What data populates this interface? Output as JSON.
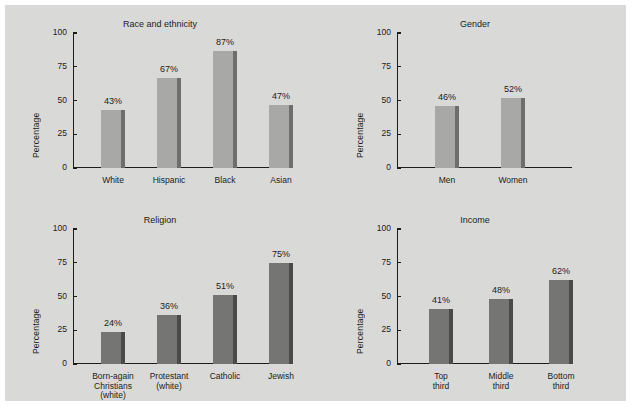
{
  "figure": {
    "background_color": "#d9d9d7",
    "outer_background_color": "#ffffff",
    "axis_color": "#1c1c1c",
    "text_color": "#1c1c1c"
  },
  "chart_data": [
    {
      "type": "bar",
      "title": "Race and ethnicity",
      "xlabel": "",
      "ylabel": "Percentage",
      "ylim": [
        0,
        100
      ],
      "yticks": [
        0,
        25,
        50,
        75,
        100
      ],
      "grid": false,
      "legend": "none",
      "bar_color": "#a8a8a6",
      "bar_shadow_color": "#6e6e6c",
      "categories": [
        "White",
        "Hispanic",
        "Black",
        "Asian"
      ],
      "values": [
        43,
        67,
        87,
        47
      ],
      "data_labels": [
        "43%",
        "67%",
        "87%",
        "47%"
      ]
    },
    {
      "type": "bar",
      "title": "Gender",
      "xlabel": "",
      "ylabel": "Percentage",
      "ylim": [
        0,
        100
      ],
      "yticks": [
        0,
        25,
        50,
        75,
        100
      ],
      "grid": false,
      "legend": "none",
      "bar_color": "#a8a8a6",
      "bar_shadow_color": "#6e6e6c",
      "categories": [
        "Men",
        "Women"
      ],
      "values": [
        46,
        52
      ],
      "data_labels": [
        "46%",
        "52%"
      ]
    },
    {
      "type": "bar",
      "title": "Religion",
      "xlabel": "",
      "ylabel": "Percentage",
      "ylim": [
        0,
        100
      ],
      "yticks": [
        0,
        25,
        50,
        75,
        100
      ],
      "grid": false,
      "legend": "none",
      "bar_color": "#757573",
      "bar_shadow_color": "#4a4a48",
      "categories": [
        "Born-again\nChristians\n(white)",
        "Protestant\n(white)",
        "Catholic",
        "Jewish"
      ],
      "values": [
        24,
        36,
        51,
        75
      ],
      "data_labels": [
        "24%",
        "36%",
        "51%",
        "75%"
      ]
    },
    {
      "type": "bar",
      "title": "Income",
      "xlabel": "",
      "ylabel": "Percentage",
      "ylim": [
        0,
        100
      ],
      "yticks": [
        0,
        25,
        50,
        75,
        100
      ],
      "grid": false,
      "legend": "none",
      "bar_color": "#757573",
      "bar_shadow_color": "#4a4a48",
      "categories": [
        "Top\nthird",
        "Middle\nthird",
        "Bottom\nthird"
      ],
      "values": [
        41,
        48,
        62
      ],
      "data_labels": [
        "41%",
        "48%",
        "62%"
      ]
    }
  ]
}
